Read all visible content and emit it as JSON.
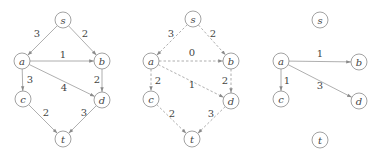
{
  "diagram": {
    "graphs": [
      {
        "id": "original",
        "style": "solid",
        "nodes": [
          {
            "id": "s",
            "label": "s",
            "x": 63,
            "y": 20
          },
          {
            "id": "a",
            "label": "a",
            "x": 22,
            "y": 61
          },
          {
            "id": "b",
            "label": "b",
            "x": 102,
            "y": 61
          },
          {
            "id": "c",
            "label": "c",
            "x": 23,
            "y": 99
          },
          {
            "id": "d",
            "label": "d",
            "x": 102,
            "y": 100
          },
          {
            "id": "t",
            "label": "t",
            "x": 63,
            "y": 139
          }
        ],
        "edges": [
          {
            "from": "s",
            "to": "a",
            "label": "3",
            "lx": 37,
            "ly": 33
          },
          {
            "from": "s",
            "to": "b",
            "label": "2",
            "lx": 85,
            "ly": 33
          },
          {
            "from": "a",
            "to": "b",
            "label": "1",
            "lx": 63,
            "ly": 54
          },
          {
            "from": "a",
            "to": "d",
            "label": "4",
            "lx": 64,
            "ly": 87
          },
          {
            "from": "a",
            "to": "c",
            "label": "3",
            "lx": 30,
            "ly": 79
          },
          {
            "from": "b",
            "to": "d",
            "label": "2",
            "lx": 97,
            "ly": 79
          },
          {
            "from": "c",
            "to": "t",
            "label": "2",
            "lx": 46,
            "ly": 112
          },
          {
            "from": "d",
            "to": "t",
            "label": "3",
            "lx": 84,
            "ly": 112
          }
        ]
      },
      {
        "id": "middle",
        "style": "dashed",
        "nodes": [
          {
            "id": "s",
            "label": "s",
            "x": 193,
            "y": 19
          },
          {
            "id": "a",
            "label": "a",
            "x": 151,
            "y": 61
          },
          {
            "id": "b",
            "label": "b",
            "x": 231,
            "y": 61
          },
          {
            "id": "c",
            "label": "c",
            "x": 151,
            "y": 99
          },
          {
            "id": "d",
            "label": "d",
            "x": 231,
            "y": 101
          },
          {
            "id": "t",
            "label": "t",
            "x": 192,
            "y": 139
          }
        ],
        "edges": [
          {
            "from": "s",
            "to": "a",
            "label": "3",
            "lx": 171,
            "ly": 33
          },
          {
            "from": "s",
            "to": "b",
            "label": "2",
            "lx": 213,
            "ly": 33
          },
          {
            "from": "a",
            "to": "b",
            "label": "0",
            "lx": 192,
            "ly": 52
          },
          {
            "from": "a",
            "to": "d",
            "label": "1",
            "lx": 192,
            "ly": 84
          },
          {
            "from": "a",
            "to": "c",
            "label": "2",
            "lx": 158,
            "ly": 80
          },
          {
            "from": "b",
            "to": "d",
            "label": "2",
            "lx": 225,
            "ly": 80
          },
          {
            "from": "c",
            "to": "t",
            "label": "2",
            "lx": 172,
            "ly": 113
          },
          {
            "from": "d",
            "to": "t",
            "label": "3",
            "lx": 211,
            "ly": 113
          }
        ]
      },
      {
        "id": "right",
        "style": "solid",
        "nodes": [
          {
            "id": "s",
            "label": "s",
            "x": 320,
            "y": 20
          },
          {
            "id": "a",
            "label": "a",
            "x": 281,
            "y": 61
          },
          {
            "id": "b",
            "label": "b",
            "x": 359,
            "y": 62
          },
          {
            "id": "c",
            "label": "c",
            "x": 281,
            "y": 99
          },
          {
            "id": "d",
            "label": "d",
            "x": 359,
            "y": 101
          },
          {
            "id": "t",
            "label": "t",
            "x": 320,
            "y": 140
          }
        ],
        "edges": [
          {
            "from": "a",
            "to": "b",
            "label": "1",
            "lx": 320,
            "ly": 53
          },
          {
            "from": "a",
            "to": "c",
            "label": "1",
            "lx": 287,
            "ly": 80
          },
          {
            "from": "a",
            "to": "d",
            "label": "3",
            "lx": 320,
            "ly": 85
          }
        ]
      }
    ],
    "colors": {
      "node_stroke": "#8a8a8a",
      "edge_stroke": "#9a9a9a",
      "text": "#444444",
      "background": "#ffffff"
    }
  }
}
